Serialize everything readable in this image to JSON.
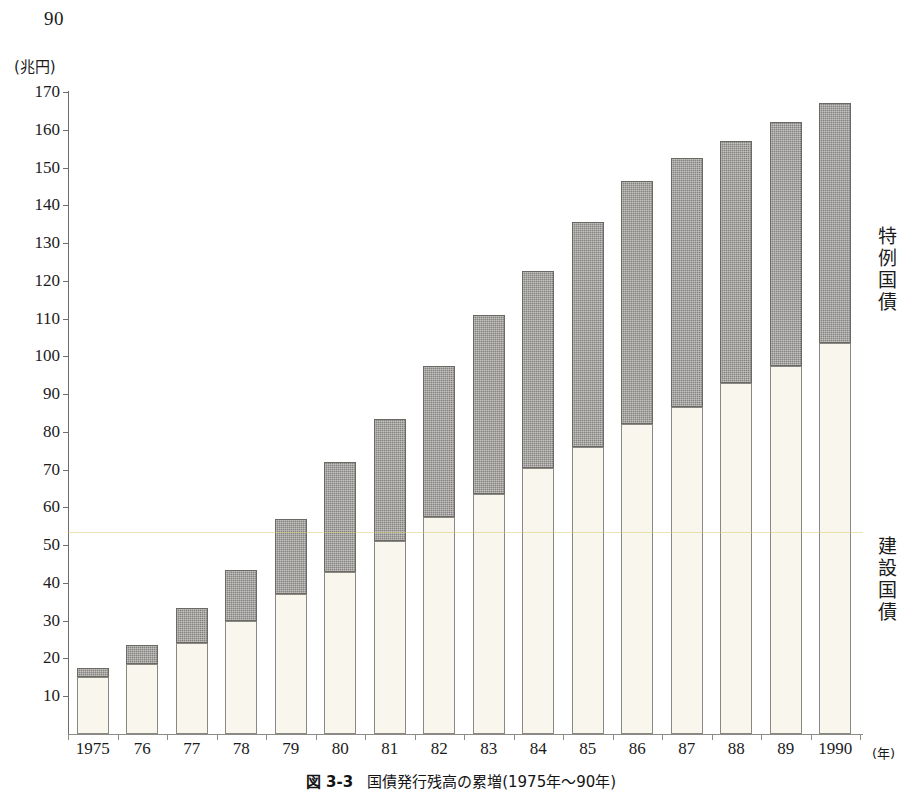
{
  "page": {
    "page_number": "90"
  },
  "chart": {
    "unit_label": "(兆円)",
    "x_axis_unit": "(年)",
    "caption_number": "図 3-3",
    "caption_text": "国債発行残高の累増(1975年〜90年)"
  },
  "legend": {
    "special": [
      "特",
      "例",
      "国",
      "債"
    ],
    "construction": [
      "建",
      "設",
      "国",
      "債"
    ]
  },
  "chart_data": {
    "type": "bar",
    "subtype": "stacked-bar",
    "title": "国債発行残高の累増(1975年〜90年)",
    "xlabel": "(年)",
    "ylabel": "(兆円)",
    "ylim": [
      0,
      170
    ],
    "yticks": [
      10,
      20,
      30,
      40,
      50,
      60,
      70,
      80,
      90,
      100,
      110,
      120,
      130,
      140,
      150,
      160,
      170
    ],
    "ytick_labels": [
      "10",
      "20",
      "30",
      "40",
      "50",
      "60",
      "70",
      "80",
      "90",
      "100",
      "110",
      "120",
      "130",
      "140",
      "150",
      "160",
      "170"
    ],
    "grid": false,
    "legend_position": "right",
    "categories": [
      "1975",
      "76",
      "77",
      "78",
      "79",
      "80",
      "81",
      "82",
      "83",
      "84",
      "85",
      "86",
      "87",
      "88",
      "89",
      "1990"
    ],
    "series": [
      {
        "name": "建設国債",
        "color": "#f8f6ed",
        "values": [
          15.0,
          18.5,
          24.0,
          30.0,
          37.0,
          43.0,
          51.0,
          57.5,
          63.5,
          70.5,
          76.0,
          82.0,
          86.5,
          93.0,
          97.5,
          103.5
        ]
      },
      {
        "name": "特例国債",
        "color": "#858380",
        "values": [
          2.5,
          5.0,
          9.5,
          13.5,
          20.0,
          29.0,
          32.5,
          40.0,
          47.5,
          52.0,
          59.5,
          64.5,
          66.0,
          64.0,
          64.5,
          63.5
        ]
      }
    ],
    "totals": [
      17.5,
      23.5,
      33.5,
      43.5,
      57.0,
      72.0,
      83.5,
      97.5,
      111.0,
      122.5,
      135.5,
      146.5,
      152.5,
      157.0,
      162.0,
      167.0
    ]
  }
}
